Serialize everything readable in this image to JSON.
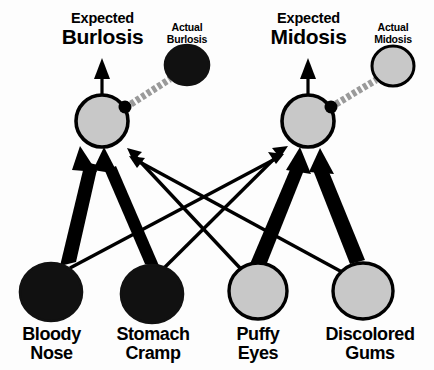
{
  "diagram": {
    "type": "causal-belief-network",
    "colors": {
      "node_present_fill": "#111111",
      "node_absent_fill": "#c8c8c8",
      "node_stroke": "#000000",
      "link_strong": "#000000",
      "link_weak": "#000000",
      "observation_link": "#9a9a9a",
      "background": "#fdfdfd",
      "text": "#000000"
    },
    "disease_nodes": [
      {
        "id": "burlosis",
        "expected_prefix": "Expected",
        "expected_name": "Burlosis",
        "actual_prefix": "Actual",
        "actual_name": "Burlosis",
        "expected_state": "gray",
        "actual_state": "black"
      },
      {
        "id": "midosis",
        "expected_prefix": "Expected",
        "expected_name": "Midosis",
        "actual_prefix": "Actual",
        "actual_name": "Midosis",
        "expected_state": "gray",
        "actual_state": "gray"
      }
    ],
    "symptom_nodes": [
      {
        "id": "bloody-nose",
        "line1": "Bloody",
        "line2": "Nose",
        "state": "black"
      },
      {
        "id": "stomach-cramp",
        "line1": "Stomach",
        "line2": "Cramp",
        "state": "black"
      },
      {
        "id": "puffy-eyes",
        "line1": "Puffy",
        "line2": "Eyes",
        "state": "gray"
      },
      {
        "id": "discolored-gums",
        "line1": "Discolored",
        "line2": "Gums",
        "state": "gray"
      }
    ],
    "links": [
      {
        "from": "bloody-nose",
        "to": "burlosis",
        "weight": "strong"
      },
      {
        "from": "stomach-cramp",
        "to": "burlosis",
        "weight": "strong"
      },
      {
        "from": "puffy-eyes",
        "to": "burlosis",
        "weight": "weak"
      },
      {
        "from": "discolored-gums",
        "to": "burlosis",
        "weight": "weak"
      },
      {
        "from": "bloody-nose",
        "to": "midosis",
        "weight": "weak"
      },
      {
        "from": "stomach-cramp",
        "to": "midosis",
        "weight": "weak"
      },
      {
        "from": "puffy-eyes",
        "to": "midosis",
        "weight": "strong"
      },
      {
        "from": "discolored-gums",
        "to": "midosis",
        "weight": "strong"
      },
      {
        "from": "burlosis",
        "to": "burlosis-output",
        "weight": "thin-up"
      },
      {
        "from": "midosis",
        "to": "midosis-output",
        "weight": "thin-up"
      },
      {
        "from": "burlosis",
        "to": "actual-burlosis",
        "weight": "observation"
      },
      {
        "from": "midosis",
        "to": "actual-midosis",
        "weight": "observation"
      }
    ]
  }
}
